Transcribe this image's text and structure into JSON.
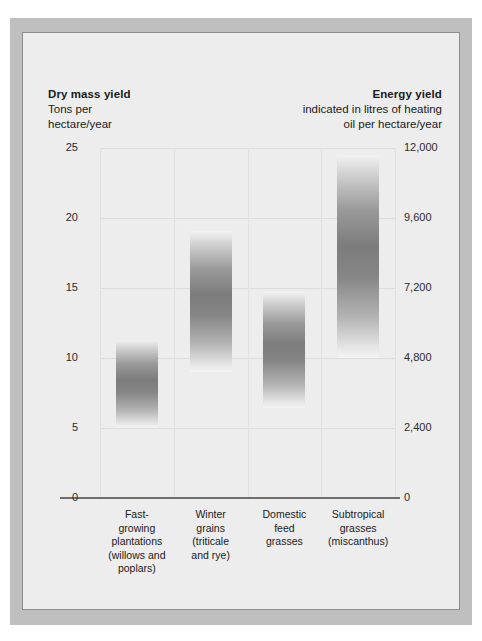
{
  "figure": {
    "frame_color": "#bfbfbf",
    "panel_color": "#ededed",
    "bar_color": "#7c7c7c"
  },
  "header_left": {
    "title": "Dry mass yield",
    "subtitle": "Tons per\nhectare/year"
  },
  "header_right": {
    "title": "Energy yield",
    "subtitle": "indicated in litres of heating\noil per hectare/year"
  },
  "chart_data": {
    "type": "bar",
    "title": "",
    "subtitle": "",
    "xlabel": "",
    "ylabel": "Tons per hectare/year",
    "ylabel_right": "indicated in litres of heating oil per hectare/year",
    "grid": true,
    "legend": "none",
    "ylim": [
      0,
      25
    ],
    "ylim_right": [
      0,
      12000
    ],
    "yticks": [
      0,
      5,
      10,
      15,
      20,
      25
    ],
    "ytick_labels": [
      "0",
      "5",
      "10",
      "15",
      "20",
      "25"
    ],
    "yticks_right": [
      0,
      2400,
      4800,
      7200,
      9600,
      12000
    ],
    "ytick_labels_right": [
      "0",
      "2,400",
      "4,800",
      "7,200",
      "9,600",
      "12,000"
    ],
    "right_axis_conversion_litres_per_ton": 480,
    "value_style": "range-bars (floating bars showing low-to-high yield range)",
    "categories": [
      "Fast-\ngrowing\nplantations\n(willows and\npoplars)",
      "Winter\ngrains\n(triticale\nand rye)",
      "Domestic\nfeed\ngrasses",
      "Subtropical\ngrasses\n(miscanthus)"
    ],
    "series": [
      {
        "name": "Dry mass yield range (tons per hectare/year)",
        "low": [
          5.0,
          9.0,
          6.4,
          10.0
        ],
        "high": [
          11.3,
          19.1,
          14.7,
          24.5
        ]
      },
      {
        "name": "Energy yield range (litres of heating oil per hectare/year)",
        "low": [
          2400,
          4320,
          3072,
          4800
        ],
        "high": [
          5424,
          9168,
          7056,
          11760
        ]
      }
    ]
  }
}
